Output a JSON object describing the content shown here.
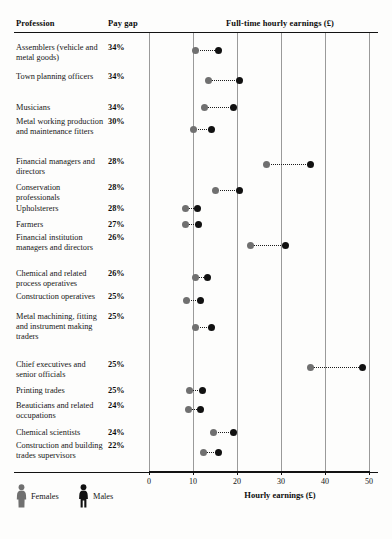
{
  "table": {
    "headers": {
      "profession": "Profession",
      "pay_gap": "Pay gap",
      "earnings": "Full-time hourly earnings (£)"
    }
  },
  "legend": {
    "female_label": "Females",
    "male_label": "Males",
    "female_color": "#707070",
    "male_color": "#111111",
    "female_icon": "person-figure-icon",
    "male_icon": "person-figure-icon"
  },
  "axis": {
    "title": "Hourly earnings (£)",
    "ticks": [
      "0",
      "10",
      "20",
      "30",
      "40",
      "50"
    ]
  },
  "chart_data": {
    "type": "scatter",
    "title": "Full-time hourly earnings (£)",
    "subtitle": "",
    "xlabel": "Hourly earnings (£)",
    "ylabel": "Profession",
    "xlim": [
      0,
      50
    ],
    "xticks": [
      0,
      10,
      20,
      30,
      40,
      50
    ],
    "grid": true,
    "legend_position": "bottom-left",
    "series": [
      {
        "name": "Females",
        "color": "#707070"
      },
      {
        "name": "Males",
        "color": "#111111"
      }
    ],
    "categories": [
      "Assemblers (vehicle and metal goods)",
      "Town planning officers",
      "Musicians",
      "Metal working production and maintenance fitters",
      "Financial managers and directors",
      "Conservation professionals",
      "Upholsterers",
      "Farmers",
      "Financial institution managers and directors",
      "Chemical and related process operatives",
      "Construction operatives",
      "Metal machining, fitting and instrument making traders",
      "Chief executives and senior officials",
      "Printing trades",
      "Beauticians and related occupations",
      "Chemical scientists",
      "Construction and building trades supervisors"
    ],
    "pay_gap": [
      "34%",
      "34%",
      "34%",
      "30%",
      "28%",
      "28%",
      "28%",
      "27%",
      "26%",
      "26%",
      "25%",
      "25%",
      "25%",
      "25%",
      "24%",
      "24%",
      "22%"
    ],
    "females": [
      10.6,
      13.6,
      12.7,
      10.1,
      26.6,
      15.2,
      8.2,
      8.3,
      23.0,
      10.5,
      8.6,
      10.6,
      36.7,
      9.3,
      9.0,
      14.7,
      12.3
    ],
    "males": [
      15.9,
      20.5,
      19.1,
      14.2,
      36.7,
      20.5,
      11.1,
      11.2,
      31.0,
      13.4,
      11.6,
      14.2,
      48.6,
      12.1,
      11.8,
      19.1,
      15.7
    ]
  },
  "rows": [
    {
      "profession": "Assemblers (vehicle and metal goods)",
      "pay_gap": "34%",
      "female": 10.6,
      "male": 15.9
    },
    {
      "profession": "Town planning officers",
      "pay_gap": "34%",
      "female": 13.6,
      "male": 20.5
    },
    {
      "profession": "Musicians",
      "pay_gap": "34%",
      "female": 12.7,
      "male": 19.1
    },
    {
      "profession": "Metal working production and maintenance fitters",
      "pay_gap": "30%",
      "female": 10.1,
      "male": 14.2
    },
    {
      "profession": "Financial managers and directors",
      "pay_gap": "28%",
      "female": 26.6,
      "male": 36.7
    },
    {
      "profession": "Conservation professionals",
      "pay_gap": "28%",
      "female": 15.2,
      "male": 20.5
    },
    {
      "profession": "Upholsterers",
      "pay_gap": "28%",
      "female": 8.2,
      "male": 11.1
    },
    {
      "profession": "Farmers",
      "pay_gap": "27%",
      "female": 8.3,
      "male": 11.2
    },
    {
      "profession": "Financial institution managers and directors",
      "pay_gap": "26%",
      "female": 23.0,
      "male": 31.0
    },
    {
      "profession": "Chemical and related process operatives",
      "pay_gap": "26%",
      "female": 10.5,
      "male": 13.4
    },
    {
      "profession": "Construction operatives",
      "pay_gap": "25%",
      "female": 8.6,
      "male": 11.6
    },
    {
      "profession": "Metal machining, fitting and instrument making traders",
      "pay_gap": "25%",
      "female": 10.6,
      "male": 14.2
    },
    {
      "profession": "Chief executives and senior officials",
      "pay_gap": "25%",
      "female": 36.7,
      "male": 48.6
    },
    {
      "profession": "Printing trades",
      "pay_gap": "25%",
      "female": 9.3,
      "male": 12.1
    },
    {
      "profession": "Beauticians and related occupations",
      "pay_gap": "24%",
      "female": 9.0,
      "male": 11.8
    },
    {
      "profession": "Chemical scientists",
      "pay_gap": "24%",
      "female": 14.7,
      "male": 19.1
    },
    {
      "profession": "Construction and building trades supervisors",
      "pay_gap": "22%",
      "female": 12.3,
      "male": 15.7
    }
  ]
}
